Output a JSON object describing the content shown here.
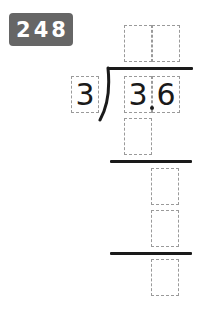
{
  "problem": {
    "number": "248",
    "divisor": "3",
    "dividend": {
      "digits": [
        "3",
        "6"
      ],
      "decimal_point": "."
    },
    "quotient_boxes": [
      "",
      ""
    ],
    "work_rows": [
      {
        "boxes": [
          ""
        ]
      },
      {
        "boxes": [
          ""
        ]
      },
      {
        "boxes": [
          ""
        ]
      },
      {
        "boxes": [
          ""
        ]
      }
    ]
  },
  "colors": {
    "badge_bg": "#666666",
    "badge_text": "#ffffff",
    "ink": "#1a1a1a",
    "box_border": "#9a9a9a"
  }
}
